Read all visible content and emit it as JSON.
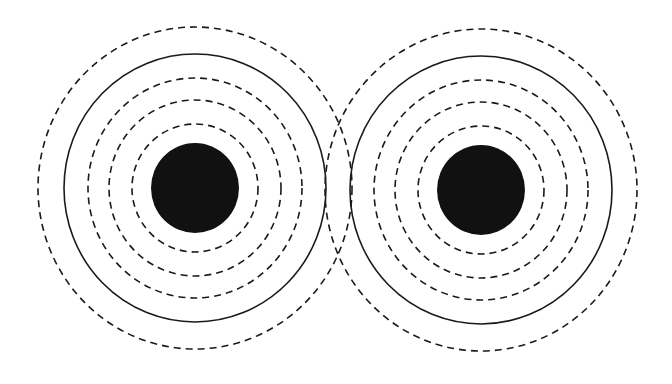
{
  "canvas": {
    "width": 672,
    "height": 384,
    "background_color": "#ffffff",
    "stroke_color": "#1a1a1a",
    "fill_color": "#111111"
  },
  "figure": {
    "title": "",
    "source_count": 2
  },
  "chart_data": {
    "type": "contour",
    "title": "",
    "subtitle": "",
    "xlabel": "",
    "ylabel": "",
    "xlim": [
      0,
      672
    ],
    "ylim": [
      0,
      384
    ],
    "grid": false,
    "legend": null,
    "annotations": [],
    "tick_labels": {
      "x": [],
      "y": []
    },
    "stroke_color": "#1a1a1a",
    "stroke_width": 1.6,
    "dash_pattern": "7 5",
    "sources": [
      {
        "name": "left-source",
        "cx": 195,
        "cy": 188,
        "disc_rx": 44,
        "disc_ry": 45,
        "disc_fill": "#111111",
        "rings": [
          {
            "label": "ring-1",
            "rx": 63,
            "ry": 64,
            "style": "dashed"
          },
          {
            "label": "ring-2",
            "rx": 86,
            "ry": 88,
            "style": "dashed"
          },
          {
            "label": "ring-3",
            "rx": 107,
            "ry": 110,
            "style": "dashed"
          },
          {
            "label": "ring-4",
            "rx": 131,
            "ry": 134,
            "style": "solid"
          },
          {
            "label": "ring-5",
            "rx": 157,
            "ry": 161,
            "style": "dashed"
          }
        ]
      },
      {
        "name": "right-source",
        "cx": 481,
        "cy": 190,
        "disc_rx": 44,
        "disc_ry": 45,
        "disc_fill": "#111111",
        "rings": [
          {
            "label": "ring-1",
            "rx": 63,
            "ry": 64,
            "style": "dashed"
          },
          {
            "label": "ring-2",
            "rx": 86,
            "ry": 88,
            "style": "dashed"
          },
          {
            "label": "ring-3",
            "rx": 107,
            "ry": 110,
            "style": "dashed"
          },
          {
            "label": "ring-4",
            "rx": 131,
            "ry": 134,
            "style": "solid"
          },
          {
            "label": "ring-5",
            "rx": 156,
            "ry": 161,
            "style": "dashed"
          }
        ]
      }
    ]
  }
}
